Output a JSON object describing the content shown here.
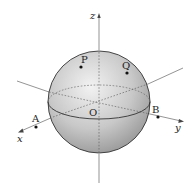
{
  "diagram": {
    "type": "3d-sphere-coordinate-axes",
    "colors": {
      "sphere_fill_light": "#e8e8e8",
      "sphere_fill_dark": "#9a9a9a",
      "outline": "#333333",
      "axis": "#555555",
      "point": "#111111"
    },
    "axes": {
      "x": {
        "label": "x"
      },
      "y": {
        "label": "y"
      },
      "z": {
        "label": "z"
      }
    },
    "origin": {
      "label": "O"
    },
    "points": [
      {
        "id": "P",
        "label": "P"
      },
      {
        "id": "Q",
        "label": "Q"
      },
      {
        "id": "A",
        "label": "A"
      },
      {
        "id": "B",
        "label": "B"
      }
    ]
  }
}
